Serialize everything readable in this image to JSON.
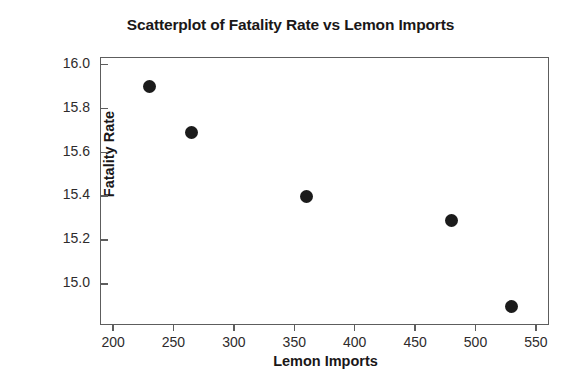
{
  "chart_data": {
    "type": "scatter",
    "title": "Scatterplot of Fatality Rate vs Lemon Imports",
    "xlabel": "Lemon Imports",
    "ylabel": "Fatality Rate",
    "xlim": [
      190,
      560
    ],
    "ylim": [
      14.82,
      16.03
    ],
    "xticks": [
      200,
      250,
      300,
      350,
      400,
      450,
      500,
      550
    ],
    "yticks": [
      "16.0",
      "15.8",
      "15.6",
      "15.4",
      "15.2",
      "15.0"
    ],
    "ytick_values": [
      16.0,
      15.8,
      15.6,
      15.4,
      15.2,
      15.0
    ],
    "grid": false,
    "legend": false,
    "marker": "filled-circle",
    "marker_color": "#1b1b1b",
    "frame_color": "#5d5d5d",
    "background": "#ffffff",
    "points": [
      {
        "x": 230,
        "y": 15.9
      },
      {
        "x": 265,
        "y": 15.69
      },
      {
        "x": 360,
        "y": 15.4
      },
      {
        "x": 480,
        "y": 15.29
      },
      {
        "x": 530,
        "y": 14.9
      }
    ],
    "series": [
      {
        "name": "Fatality Rate vs Lemon Imports",
        "x": [
          230,
          265,
          360,
          480,
          530
        ],
        "values": [
          15.9,
          15.69,
          15.4,
          15.29,
          14.9
        ]
      }
    ]
  }
}
